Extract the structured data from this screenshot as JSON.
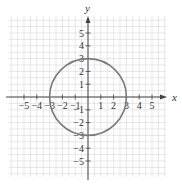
{
  "chart_data": {
    "type": "line",
    "title": "",
    "xlabel": "x",
    "ylabel": "y",
    "xlim": [
      -6,
      6
    ],
    "ylim": [
      -6,
      6
    ],
    "grid": true,
    "grid_step": 0.5,
    "x_ticks": [
      -5,
      -4,
      -3,
      -2,
      -1,
      1,
      2,
      3,
      4,
      5
    ],
    "y_ticks": [
      -5,
      -4,
      -3,
      -2,
      -1,
      1,
      2,
      3,
      4,
      5
    ],
    "x_tick_labels": [
      "−5",
      "−4",
      "−3",
      "−2",
      "−1",
      "1",
      "2",
      "3",
      "4",
      "5"
    ],
    "y_tick_labels": [
      "−5",
      "−4",
      "−3",
      "−2",
      "−1",
      "1",
      "2",
      "3",
      "4",
      "5"
    ],
    "series": [
      {
        "name": "circle",
        "shape": "circle",
        "equation": "x^2 + y^2 = 9",
        "center": [
          0,
          0
        ],
        "radius": 3,
        "color": "#7a7a7a"
      }
    ],
    "legend": null
  },
  "colors": {
    "grid": "#dcdcdc",
    "axis": "#444444",
    "curve": "#7a7a7a",
    "text": "#333333"
  },
  "labels": {
    "x_axis": "x",
    "y_axis": "y"
  }
}
